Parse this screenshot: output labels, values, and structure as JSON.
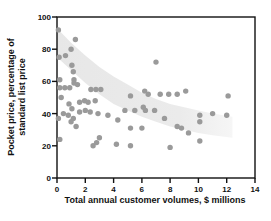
{
  "chart_data": {
    "type": "scatter",
    "title": "",
    "xlabel": "Total annual customer volumes, $ millions",
    "ylabel": "Pocket price, percentage of standard list price",
    "ylabel_line1": "Pocket price, percentage of",
    "ylabel_line2": "standard list price",
    "xlim": [
      0,
      14
    ],
    "ylim": [
      0,
      100
    ],
    "x_ticks": [
      0,
      2,
      4,
      6,
      8,
      10,
      12,
      14
    ],
    "y_ticks": [
      0,
      20,
      40,
      60,
      80,
      100
    ],
    "grid": false,
    "legend": "none",
    "point_color": "#9a9a9a",
    "point_radius": 2.7,
    "axis_color": "#111111",
    "band_color_start": "#e7e7e7",
    "band_color_end": "#f6f6f6",
    "points": [
      [
        0.1,
        92
      ],
      [
        1.3,
        86
      ],
      [
        1.0,
        80
      ],
      [
        0.15,
        75
      ],
      [
        0.6,
        76
      ],
      [
        1.05,
        70
      ],
      [
        1.15,
        66
      ],
      [
        1.2,
        61
      ],
      [
        0.2,
        61
      ],
      [
        0.2,
        56
      ],
      [
        0.55,
        56
      ],
      [
        0.9,
        56
      ],
      [
        1.2,
        59
      ],
      [
        1.45,
        58
      ],
      [
        2.4,
        55
      ],
      [
        2.75,
        55
      ],
      [
        3.1,
        55
      ],
      [
        0.3,
        50
      ],
      [
        0.85,
        46
      ],
      [
        1.05,
        43
      ],
      [
        1.6,
        47
      ],
      [
        1.95,
        48
      ],
      [
        2.2,
        47
      ],
      [
        2.7,
        48
      ],
      [
        0.1,
        37
      ],
      [
        0.45,
        40
      ],
      [
        0.8,
        39
      ],
      [
        1.15,
        37
      ],
      [
        1.6,
        41
      ],
      [
        2.0,
        42
      ],
      [
        2.35,
        41
      ],
      [
        2.9,
        40
      ],
      [
        1.0,
        35
      ],
      [
        1.35,
        32
      ],
      [
        3.6,
        39
      ],
      [
        4.3,
        36
      ],
      [
        4.8,
        42
      ],
      [
        0.2,
        24
      ],
      [
        2.55,
        20
      ],
      [
        2.8,
        22
      ],
      [
        3.0,
        25
      ],
      [
        4.2,
        21
      ],
      [
        5.2,
        20
      ],
      [
        8.0,
        19
      ],
      [
        10.1,
        23
      ],
      [
        5.2,
        51
      ],
      [
        6.2,
        54
      ],
      [
        6.45,
        52
      ],
      [
        5.5,
        42
      ],
      [
        6.1,
        44
      ],
      [
        6.25,
        42
      ],
      [
        6.9,
        42
      ],
      [
        5.2,
        31
      ],
      [
        6.0,
        31
      ],
      [
        7.0,
        72
      ],
      [
        7.3,
        52
      ],
      [
        7.9,
        52
      ],
      [
        8.5,
        52
      ],
      [
        9.1,
        54
      ],
      [
        7.6,
        37
      ],
      [
        8.5,
        32
      ],
      [
        8.8,
        31
      ],
      [
        9.3,
        28
      ],
      [
        10.1,
        39
      ],
      [
        10.1,
        35
      ],
      [
        11.0,
        40
      ],
      [
        12.0,
        39
      ],
      [
        12.1,
        51
      ]
    ],
    "trend_band": {
      "upper": [
        [
          0,
          93
        ],
        [
          1,
          84
        ],
        [
          2,
          76
        ],
        [
          3,
          69
        ],
        [
          4,
          63
        ],
        [
          5,
          58
        ],
        [
          6,
          53
        ],
        [
          7,
          49
        ],
        [
          8,
          46
        ],
        [
          9,
          44
        ],
        [
          10,
          42
        ],
        [
          11,
          40
        ],
        [
          12.4,
          38
        ]
      ],
      "lower": [
        [
          0,
          75
        ],
        [
          1,
          67
        ],
        [
          2,
          59
        ],
        [
          3,
          52
        ],
        [
          4,
          46
        ],
        [
          5,
          42
        ],
        [
          6,
          38
        ],
        [
          7,
          35
        ],
        [
          8,
          32
        ],
        [
          9,
          30
        ],
        [
          10,
          28
        ],
        [
          11,
          26.5
        ],
        [
          12.4,
          25
        ]
      ]
    },
    "layout": {
      "plot_left": 57,
      "plot_top": 17,
      "plot_right": 255,
      "plot_bottom": 178,
      "tick_len": 5
    }
  }
}
